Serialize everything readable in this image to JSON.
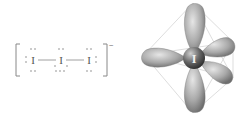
{
  "figure": {
    "left_panel": {
      "title": "Lewis structure of triiodide ion",
      "atoms": [
        {
          "symbol": "I",
          "position": "left",
          "lone_pairs": 3
        },
        {
          "symbol": "I",
          "position": "center",
          "lone_pairs": 3
        },
        {
          "symbol": "I",
          "position": "right",
          "lone_pairs": 3
        }
      ],
      "bonds": [
        "I–I",
        "I–I"
      ],
      "charge": "−",
      "colors": {
        "ink": "#777777"
      }
    },
    "right_panel": {
      "title": "Orbital geometry (trigonal bipyramidal)",
      "central_atom": "I",
      "lobes": 5,
      "colors": {
        "lobe": "#9a9a9a",
        "sphere": "#555555",
        "frame": "#cccccc"
      }
    }
  }
}
